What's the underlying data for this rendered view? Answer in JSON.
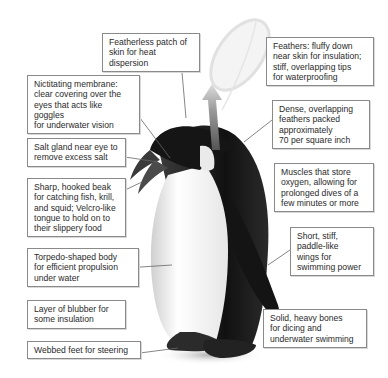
{
  "figure": {
    "labels": [
      {
        "id": "featherless-patch",
        "text": "Featherless patch of\nskin for heat dispersion"
      },
      {
        "id": "feathers",
        "text": "Feathers: fluffy down\nnear skin for insulation;\nstiff, overlapping tips\nfor waterproofing"
      },
      {
        "id": "nictitating-membrane",
        "text": "Nictitating membrane:\nclear covering over the\neyes that acts like goggles\nfor underwater vision"
      },
      {
        "id": "dense-feathers",
        "text": "Dense, overlapping\nfeathers packed\napproximately\n70 per square inch"
      },
      {
        "id": "salt-gland",
        "text": "Salt gland near eye to\nremove excess salt"
      },
      {
        "id": "muscles",
        "text": "Muscles that store\noxygen, allowing for\nprolonged dives of a\nfew minutes or more"
      },
      {
        "id": "beak",
        "text": "Sharp, hooked beak\nfor catching fish, krill,\nand squid; Velcro-like\ntongue to hold on to\ntheir slippery food"
      },
      {
        "id": "wings",
        "text": "Short, stiff,\npaddle-like\nwings for\nswimming power"
      },
      {
        "id": "torpedo-body",
        "text": "Torpedo-shaped body\nfor efficient propulsion\nunder water"
      },
      {
        "id": "blubber",
        "text": "Layer of blubber for\nsome insulation"
      },
      {
        "id": "bones",
        "text": "Solid, heavy bones\nfor dicing and\nunderwater swimming"
      },
      {
        "id": "webbed-feet",
        "text": "Webbed feet for steering"
      }
    ]
  }
}
